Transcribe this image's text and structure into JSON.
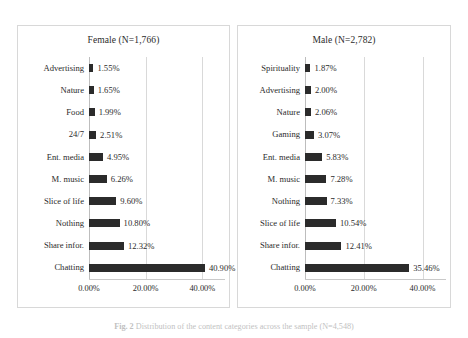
{
  "figure": {
    "caption_label": "Fig. 2",
    "caption_text": "Distribution of the content categories across the sample (N=4,548)"
  },
  "axis": {
    "tick_labels": [
      "0.00%",
      "20.00%",
      "40.00%"
    ],
    "tick_values": [
      0,
      20,
      40
    ],
    "xmax": 48
  },
  "panels": [
    {
      "id": "female",
      "title": "Female (N=1,766)",
      "categories": [
        "Advertising",
        "Nature",
        "Food",
        "24/7",
        "Ent. media",
        "M. music",
        "Slice of life",
        "Nothing",
        "Share infor.",
        "Chatting"
      ],
      "values": [
        1.55,
        1.65,
        1.99,
        2.51,
        4.95,
        6.26,
        9.6,
        10.8,
        12.32,
        40.9
      ],
      "labels": [
        "1.55%",
        "1.65%",
        "1.99%",
        "2.51%",
        "4.95%",
        "6.26%",
        "9.60%",
        "10.80%",
        "12.32%",
        "40.90%"
      ]
    },
    {
      "id": "male",
      "title": "Male (N=2,782)",
      "categories": [
        "Spirituality",
        "Advertising",
        "Nature",
        "Gaming",
        "Ent. media",
        "M. music",
        "Nothing",
        "Slice of life",
        "Share infor.",
        "Chatting"
      ],
      "values": [
        1.87,
        2.0,
        2.06,
        3.07,
        5.83,
        7.28,
        7.33,
        10.54,
        12.41,
        35.46
      ],
      "labels": [
        "1.87%",
        "2.00%",
        "2.06%",
        "3.07%",
        "5.83%",
        "7.28%",
        "7.33%",
        "10.54%",
        "12.41%",
        "35.46%"
      ]
    }
  ],
  "chart_data": {
    "type": "bar",
    "orientation": "horizontal",
    "title": "",
    "xlabel": "",
    "ylabel": "",
    "xlim": [
      0,
      48
    ],
    "grid": true,
    "legend": "none",
    "xticks": [
      0,
      20,
      40
    ],
    "xticklabels": [
      "0.00%",
      "20.00%",
      "40.00%"
    ],
    "panels": [
      {
        "name": "Female (N=1,766)",
        "n": 1766,
        "categories": [
          "Advertising",
          "Nature",
          "Food",
          "24/7",
          "Ent. media",
          "M. music",
          "Slice of life",
          "Nothing",
          "Share infor.",
          "Chatting"
        ],
        "values": [
          1.55,
          1.65,
          1.99,
          2.51,
          4.95,
          6.26,
          9.6,
          10.8,
          12.32,
          40.9
        ],
        "data_labels": [
          "1.55%",
          "1.65%",
          "1.99%",
          "2.51%",
          "4.95%",
          "6.26%",
          "9.60%",
          "10.80%",
          "12.32%",
          "40.90%"
        ]
      },
      {
        "name": "Male (N=2,782)",
        "n": 2782,
        "categories": [
          "Spirituality",
          "Advertising",
          "Nature",
          "Gaming",
          "Ent. media",
          "M. music",
          "Nothing",
          "Slice of life",
          "Share infor.",
          "Chatting"
        ],
        "values": [
          1.87,
          2.0,
          2.06,
          3.07,
          5.83,
          7.28,
          7.33,
          10.54,
          12.41,
          35.46
        ],
        "data_labels": [
          "1.87%",
          "2.00%",
          "2.06%",
          "3.07%",
          "5.83%",
          "7.28%",
          "7.33%",
          "10.54%",
          "12.41%",
          "35.46%"
        ]
      }
    ],
    "colors": {
      "bar": "#2b2b2b",
      "grid": "#d9d9d9",
      "text": "#2b2b2b"
    }
  }
}
